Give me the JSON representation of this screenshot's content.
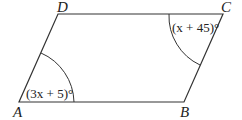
{
  "figure": {
    "type": "parallelogram",
    "vertices": [
      {
        "name": "A",
        "x": 19,
        "y": 102
      },
      {
        "name": "B",
        "x": 184,
        "y": 102
      },
      {
        "name": "C",
        "x": 223,
        "y": 14
      },
      {
        "name": "D",
        "x": 58,
        "y": 14
      }
    ],
    "vertex_labels": {
      "A": "A",
      "B": "B",
      "C": "C",
      "D": "D"
    },
    "angles": {
      "A": {
        "label": "(3x + 5)°",
        "x_var": "x"
      },
      "C": {
        "label": "(x + 45)°",
        "x_var": "x"
      }
    },
    "colors": {
      "stroke": "#333333",
      "text": "#222222",
      "background": "#ffffff"
    }
  }
}
